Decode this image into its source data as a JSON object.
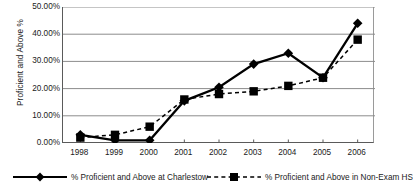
{
  "chart_data": {
    "type": "line",
    "title": "",
    "xlabel": "",
    "ylabel": "Proficient and Above %",
    "categories": [
      "1998",
      "1999",
      "2000",
      "2001",
      "2002",
      "2003",
      "2004",
      "2005",
      "2006"
    ],
    "ylim": [
      0,
      0.5
    ],
    "ytick_values": [
      0.5,
      0.4,
      0.3,
      0.2,
      0.1,
      0.0
    ],
    "ytick_labels": [
      "50.00%",
      "40.00%",
      "30.00%",
      "20.00%",
      "10.00%",
      "0.00%"
    ],
    "grid": "horizontal",
    "legend_position": "bottom",
    "series": [
      {
        "name": "% Proficient and Above at Charlestow",
        "marker": "diamond",
        "line_style": "solid",
        "color": "#000000",
        "values": [
          0.03,
          0.01,
          0.01,
          0.155,
          0.205,
          0.29,
          0.33,
          0.24,
          0.44
        ]
      },
      {
        "name": "% Proficient and Above in Non-Exam HS",
        "marker": "square",
        "line_style": "dashed",
        "color": "#000000",
        "values": [
          0.02,
          0.03,
          0.06,
          0.16,
          0.18,
          0.19,
          0.21,
          0.24,
          0.38
        ]
      }
    ]
  },
  "axis": {
    "y_title": "Proficient and Above %"
  },
  "legend": {
    "items": [
      {
        "label": "% Proficient and Above at Charlestow"
      },
      {
        "label": "% Proficient and Above in Non-Exam HS"
      }
    ]
  },
  "colors": {
    "series_line": "#000000",
    "gridline": "#8c8c8c",
    "axis": "#5a5a5a",
    "text": "#1a1a1a",
    "background": "#ffffff"
  }
}
